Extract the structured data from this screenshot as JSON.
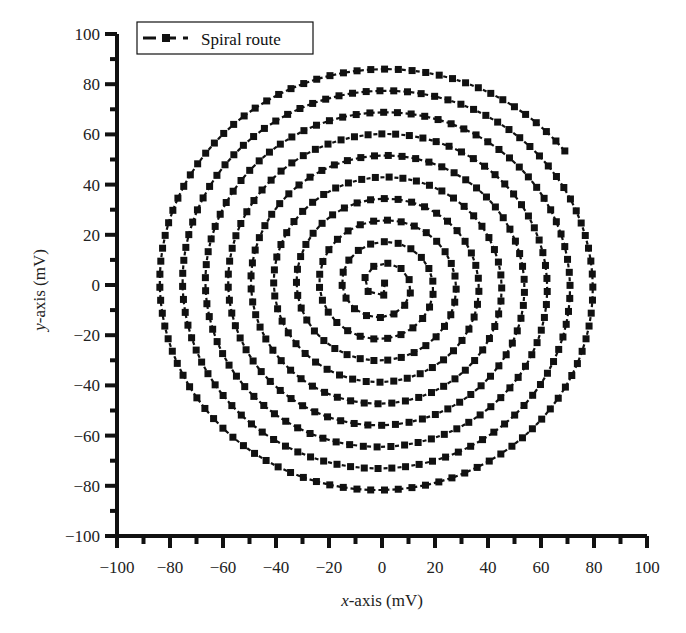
{
  "chart_data": {
    "type": "line",
    "title": "",
    "xlabel": "x-axis (mV)",
    "xlabel_italic_part": "x",
    "xlabel_rest": "-axis (mV)",
    "ylabel": "y-axis (mV)",
    "ylabel_italic_part": "y",
    "ylabel_rest": "-axis (mV)",
    "xlim": [
      -100,
      100
    ],
    "ylim": [
      -100,
      100
    ],
    "xticks": [
      -100,
      -80,
      -60,
      -40,
      -20,
      0,
      20,
      40,
      60,
      80,
      100
    ],
    "yticks": [
      -100,
      -80,
      -60,
      -40,
      -20,
      0,
      20,
      40,
      60,
      80,
      100
    ],
    "xtick_labels": [
      "−100",
      "−80",
      "−60",
      "−40",
      "−20",
      "0",
      "20",
      "40",
      "60",
      "80",
      "100"
    ],
    "ytick_labels": [
      "−100",
      "−80",
      "−60",
      "−40",
      "−20",
      "0",
      "20",
      "40",
      "60",
      "80",
      "100"
    ],
    "grid": false,
    "legend": {
      "position": "upper-left",
      "entries": [
        "Spiral route"
      ]
    },
    "series": [
      {
        "name": "Spiral route",
        "marker": "square",
        "line_style": "dashed",
        "color": "#111111",
        "description": "Archimedean spiral starting near origin (0,0), winding outward about 10 turns, ending near (-34,-83)",
        "spiral": {
          "center": [
            0,
            0
          ],
          "turn_spacing": 8.6,
          "turns": 10.15,
          "marker_spacing": 5.2,
          "start_angle_deg": 90,
          "direction": "clockwise"
        },
        "key_points": [
          {
            "x": -4,
            "y": 7
          },
          {
            "x": 0,
            "y": -6
          },
          {
            "x": 6,
            "y": 5
          },
          {
            "x": 0,
            "y": 86
          },
          {
            "x": 85,
            "y": 0
          },
          {
            "x": 0,
            "y": -82
          },
          {
            "x": -88,
            "y": 0
          },
          {
            "x": -34,
            "y": -83
          }
        ]
      }
    ]
  },
  "legend": {
    "label": "Spiral route"
  }
}
